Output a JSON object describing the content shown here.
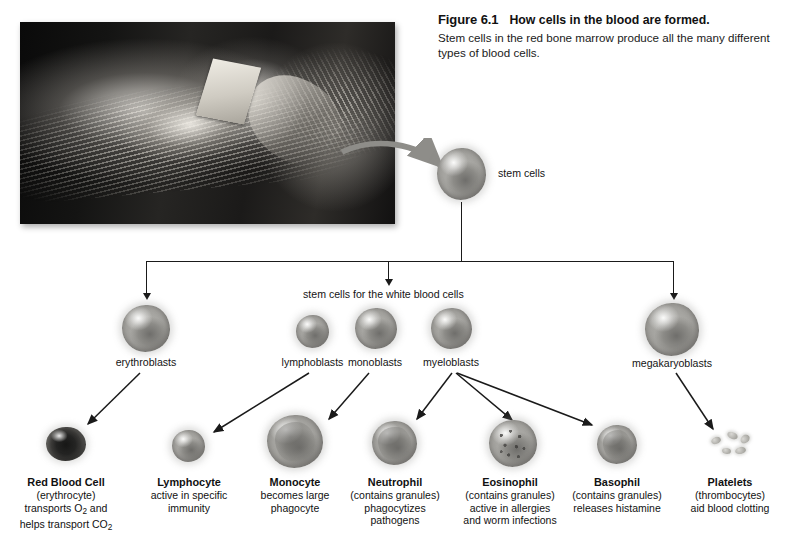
{
  "figure": {
    "number": "Figure 6.1",
    "title": "How cells in the blood are formed.",
    "description": "Stem cells in the red bone marrow produce all the many different types of blood cells."
  },
  "photo": {
    "alt": "Person reading a book while lying in a hammock, black and white photograph"
  },
  "diagram": {
    "stem_cells_label": "stem cells",
    "white_blood_branch_label": "stem cells for the white blood cells",
    "progenitors": [
      {
        "id": "erythroblasts",
        "label": "erythroblasts"
      },
      {
        "id": "lymphoblasts",
        "label": "lymphoblasts"
      },
      {
        "id": "monoblasts",
        "label": "monoblasts"
      },
      {
        "id": "myeloblasts",
        "label": "myeloblasts"
      },
      {
        "id": "megakaryoblasts",
        "label": "megakaryoblasts"
      }
    ],
    "mature_cells": [
      {
        "id": "red-blood-cell",
        "name": "Red Blood Cell",
        "line1": "(erythrocyte)",
        "line2": "transports O",
        "line2_sub": "2",
        "line2_tail": " and",
        "line3": "helps transport CO",
        "line3_sub": "2"
      },
      {
        "id": "lymphocyte",
        "name": "Lymphocyte",
        "line1": "active in specific",
        "line2": "immunity"
      },
      {
        "id": "monocyte",
        "name": "Monocyte",
        "line1": "becomes large",
        "line2": "phagocyte"
      },
      {
        "id": "neutrophil",
        "name": "Neutrophil",
        "line1": "(contains granules)",
        "line2": "phagocytizes",
        "line3": "pathogens"
      },
      {
        "id": "eosinophil",
        "name": "Eosinophil",
        "line1": "(contains granules)",
        "line2": "active in allergies",
        "line3": "and worm infections"
      },
      {
        "id": "basophil",
        "name": "Basophil",
        "line1": "(contains granules)",
        "line2": "releases histamine"
      },
      {
        "id": "platelets",
        "name": "Platelets",
        "line1": "(thrombocytes)",
        "line2": "aid blood clotting"
      }
    ]
  },
  "colors": {
    "background": "#ffffff",
    "text": "#141414",
    "line": "#1a1a1a",
    "arrow_photo": "#8e8d89"
  }
}
